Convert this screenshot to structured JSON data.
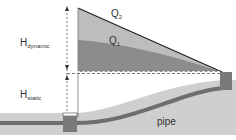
{
  "diagram": {
    "labels": {
      "h_dynamic": {
        "main": "H",
        "sub": "dynamic"
      },
      "h_static": {
        "main": "H",
        "sub": "static"
      },
      "q2": {
        "main": "Q",
        "sub": "2"
      },
      "q1": {
        "main": "Q",
        "sub": "1"
      },
      "pipe": "pipe"
    },
    "colors": {
      "q2_fill": "#bdbdbd",
      "q1_fill": "#8c8c8c",
      "ground": "#cfcfcf",
      "pipe": "#6e6e6e",
      "tank": "#7a7a7a",
      "line": "#222222"
    }
  }
}
